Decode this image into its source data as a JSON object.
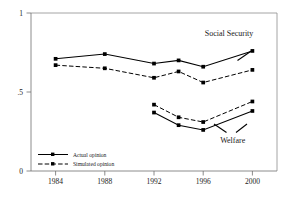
{
  "chart_data": {
    "type": "line",
    "title": "",
    "subtitle": "",
    "xlabel": "",
    "ylabel": "",
    "x": [
      1984,
      1988,
      1992,
      1994,
      1996,
      2000
    ],
    "xtick_labels": [
      "1984",
      "1988",
      "1992",
      "1996",
      "2000"
    ],
    "xticks": [
      1984,
      1988,
      1992,
      1996,
      2000
    ],
    "ytick_labels": [
      "0",
      ".5",
      "1"
    ],
    "yticks": [
      0,
      0.5,
      1
    ],
    "xlim": [
      1982,
      2002
    ],
    "ylim": [
      0,
      1
    ],
    "grid": false,
    "legend_position": "lower-left-inside",
    "series": [
      {
        "name": "Social Security — Actual opinion",
        "group": "Social Security",
        "style": "solid",
        "x": [
          1984,
          1988,
          1992,
          1994,
          1996,
          2000
        ],
        "values": [
          0.71,
          0.74,
          0.68,
          0.7,
          0.66,
          0.76
        ]
      },
      {
        "name": "Social Security — Simulated opinion",
        "group": "Social Security",
        "style": "dashed",
        "x": [
          1984,
          1988,
          1992,
          1994,
          1996,
          2000
        ],
        "values": [
          0.67,
          0.65,
          0.59,
          0.63,
          0.56,
          0.64
        ]
      },
      {
        "name": "Welfare — Actual opinion",
        "group": "Welfare",
        "style": "solid",
        "x": [
          1992,
          1994,
          1996,
          2000
        ],
        "values": [
          0.37,
          0.29,
          0.26,
          0.38
        ]
      },
      {
        "name": "Welfare — Simulated opinion",
        "group": "Welfare",
        "style": "dashed",
        "x": [
          1992,
          1994,
          1996,
          2000
        ],
        "values": [
          0.42,
          0.34,
          0.31,
          0.44
        ]
      }
    ],
    "annotations": [
      {
        "text": "Social Security",
        "x": 1998.1,
        "y": 0.855,
        "anchor": "middle"
      },
      {
        "text": "Welfare",
        "x": 1998.4,
        "y": 0.175,
        "anchor": "middle"
      }
    ],
    "legend": [
      {
        "label": "Actual opinion",
        "style": "solid"
      },
      {
        "label": "Simulated opinion",
        "style": "dashed"
      }
    ]
  }
}
